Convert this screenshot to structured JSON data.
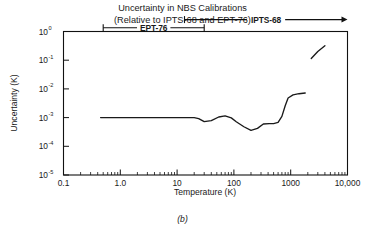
{
  "figure": {
    "title_line1": "Uncertainty in NBS Calibrations",
    "title_line2": "(Relative to IPTS-68 and EPT-76)",
    "caption": "(b)"
  },
  "chart_data": {
    "type": "line",
    "title": "Uncertainty in NBS Calibrations (Relative to IPTS-68 and EPT-76)",
    "xlabel": "Temperature (K)",
    "ylabel": "Uncertainty (K)",
    "xscale": "log",
    "yscale": "log",
    "xlim": [
      0.1,
      10000
    ],
    "ylim": [
      1e-05,
      1
    ],
    "grid": false,
    "legend": "none",
    "xticklabels": [
      "0.1",
      "1.0",
      "10",
      "100",
      "1000",
      "10,000"
    ],
    "xtickvalues": [
      0.1,
      1,
      10,
      100,
      1000,
      10000
    ],
    "ytickmantissas": [
      "10",
      "10",
      "10",
      "10",
      "10",
      "10"
    ],
    "ytickexponents": [
      "-5",
      "-4",
      "-3",
      "-2",
      "-1",
      "0"
    ],
    "ytickvalues": [
      1e-05,
      0.0001,
      0.001,
      0.01,
      0.1,
      1
    ],
    "series": [
      {
        "name": "NBS calibration uncertainty (main branch)",
        "x": [
          0.45,
          1.0,
          3.0,
          8.0,
          14.0,
          20.0,
          24.0,
          30.0,
          40.0,
          54.0,
          70.0,
          90.0,
          110.0,
          150.0,
          200.0,
          260.0,
          330.0,
          420.0,
          500.0,
          600.0,
          700.0,
          800.0,
          900.0,
          1100.0,
          1400.0,
          1800.0
        ],
        "y": [
          0.001,
          0.001,
          0.001,
          0.001,
          0.001,
          0.001,
          0.00092,
          0.00072,
          0.00078,
          0.00105,
          0.00115,
          0.00098,
          0.00072,
          0.00048,
          0.00036,
          0.00042,
          0.0006,
          0.00062,
          0.00062,
          0.00068,
          0.0011,
          0.0026,
          0.0048,
          0.0062,
          0.0068,
          0.0072
        ]
      },
      {
        "name": "NBS calibration uncertainty (high-temperature branch)",
        "x": [
          2300.0,
          3000.0,
          4000.0
        ],
        "y": [
          0.115,
          0.2,
          0.32
        ]
      }
    ],
    "annotations": [
      {
        "label": "IPTS-68",
        "x_start": 13.5,
        "x_end": 10000,
        "y_value": 2.6,
        "start_cap": "tick",
        "end_cap": "arrow"
      },
      {
        "label": "EPT-76",
        "x_start": 0.5,
        "x_end": 30,
        "y_value": 1.35,
        "start_cap": "tick",
        "end_cap": "tick"
      }
    ]
  }
}
